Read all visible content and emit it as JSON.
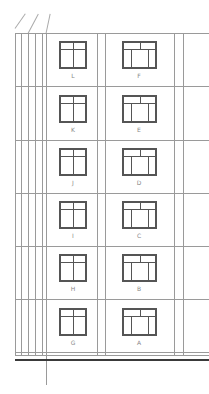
{
  "drawing": {
    "type": "building-elevation",
    "rows": [
      {
        "left_label": "L",
        "right_label": "F"
      },
      {
        "left_label": "K",
        "right_label": "E"
      },
      {
        "left_label": "J",
        "right_label": "D"
      },
      {
        "left_label": "I",
        "right_label": "C"
      },
      {
        "left_label": "H",
        "right_label": "B"
      },
      {
        "left_label": "G",
        "right_label": "A"
      }
    ],
    "line_color": "#9a9a9a",
    "window_color": "#555555"
  }
}
